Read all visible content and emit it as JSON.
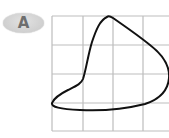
{
  "badge": {
    "label": "A",
    "color": "#d4d4d4",
    "text_color": "#6e6e6e"
  },
  "grid": {
    "line_color": "#bdbdbd",
    "x_lines": [
      52,
      83,
      113,
      143
    ],
    "y_lines": [
      16,
      45,
      74,
      103,
      131
    ],
    "x_start": 52,
    "x_end": 169,
    "y_start": 16,
    "y_end": 131
  },
  "shape": {
    "stroke_color": "#111111",
    "stroke_width": 2,
    "description": "closed irregular curved shape on a grid"
  }
}
